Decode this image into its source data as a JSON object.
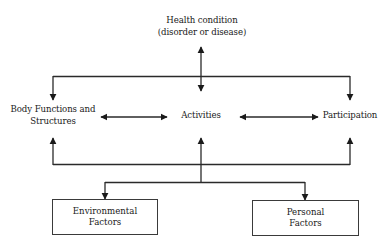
{
  "diagram": {
    "type": "flow-diagram",
    "nodes": {
      "health_condition": {
        "line1": "Health condition",
        "line2": "(disorder or disease)"
      },
      "body_functions": {
        "line1": "Body Functions and",
        "line2": "Structures"
      },
      "activities": {
        "label": "Activities"
      },
      "participation": {
        "label": "Participation"
      },
      "environmental_factors": {
        "line1": "Environmental",
        "line2": "Factors"
      },
      "personal_factors": {
        "line1": "Personal",
        "line2": "Factors"
      }
    },
    "edges": [
      {
        "from": "health_condition",
        "to": "activities",
        "style": "bidirectional"
      },
      {
        "from": "health_condition",
        "to": "body_functions",
        "style": "directed"
      },
      {
        "from": "health_condition",
        "to": "participation",
        "style": "directed"
      },
      {
        "from": "body_functions",
        "to": "activities",
        "style": "bidirectional"
      },
      {
        "from": "activities",
        "to": "participation",
        "style": "bidirectional"
      },
      {
        "from": "environmental_factors",
        "to": "body_functions",
        "style": "directed"
      },
      {
        "from": "environmental_factors",
        "to": "activities",
        "style": "directed"
      },
      {
        "from": "environmental_factors",
        "to": "participation",
        "style": "directed"
      },
      {
        "from": "activities",
        "to": "environmental_factors",
        "style": "directed"
      },
      {
        "from": "activities",
        "to": "personal_factors",
        "style": "directed"
      }
    ],
    "colors": {
      "line": "#2a2a2a",
      "text": "#1a1a1a",
      "background": "#ffffff"
    }
  }
}
